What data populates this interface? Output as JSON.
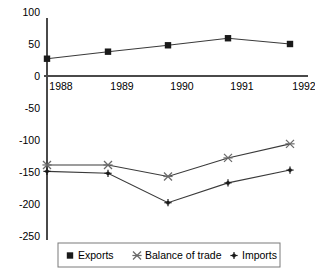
{
  "chart_data": {
    "type": "line",
    "title": "",
    "xlabel": "",
    "ylabel": "",
    "categories": [
      "1988",
      "1989",
      "1990",
      "1991",
      "1992"
    ],
    "x": [
      1988,
      1989,
      1990,
      1991,
      1992
    ],
    "ylim": [
      -250,
      100
    ],
    "yticks": [
      100,
      50,
      0,
      -50,
      -100,
      -150,
      -200,
      -250
    ],
    "ytick_labels": [
      "100",
      "50",
      "0",
      "-50",
      "-100",
      "-150",
      "-200",
      "-250"
    ],
    "grid": false,
    "legend_position": "bottom",
    "series": [
      {
        "name": "Exports",
        "marker": "square",
        "values": [
          27,
          38,
          48,
          59,
          50
        ]
      },
      {
        "name": "Balance of trade",
        "marker": "cross",
        "values": [
          -139,
          -139,
          -157,
          -128,
          -106
        ]
      },
      {
        "name": "Imports",
        "marker": "plus",
        "values": [
          -149,
          -152,
          -198,
          -167,
          -147
        ]
      }
    ],
    "colors": {
      "exports": "#1a1a1a",
      "balance_of_trade": "#6a6a6a",
      "imports": "#1a1a1a",
      "axis": "#4a4a4a",
      "line": "#3a3a3a",
      "legend_border": "#7a7a7a",
      "background": "#ffffff"
    }
  },
  "legend": {
    "items": [
      {
        "label": "Exports",
        "marker": "square-marker"
      },
      {
        "label": "Balance of trade",
        "marker": "cross-marker"
      },
      {
        "label": "Imports",
        "marker": "plus-marker"
      }
    ]
  },
  "axis": {
    "y_tick_labels": [
      "100",
      "50",
      "0",
      "-50",
      "-100",
      "-150",
      "-200",
      "-250"
    ],
    "x_tick_labels": [
      "1988",
      "1989",
      "1990",
      "1991",
      "1992"
    ]
  }
}
